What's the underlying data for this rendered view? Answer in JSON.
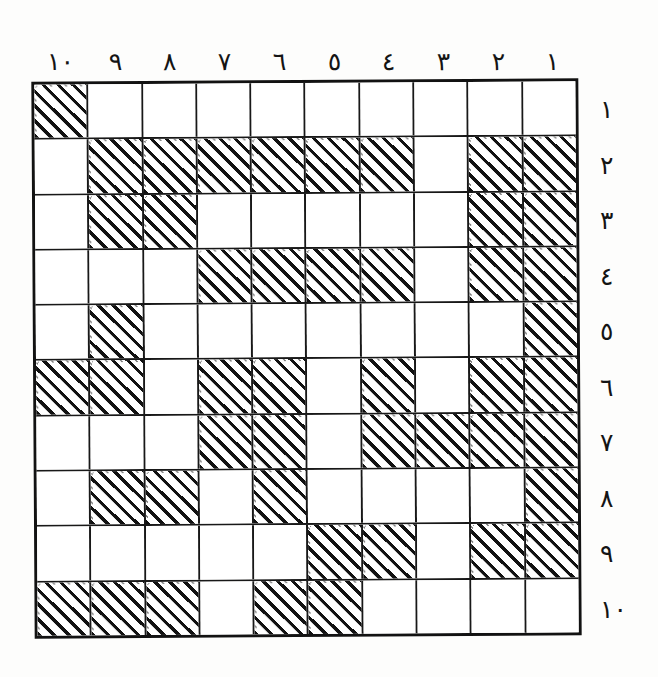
{
  "figure": {
    "type": "hand-drawn-grid",
    "rows": 10,
    "columns": 10,
    "numeral_system": "arabic-indic",
    "column_order": "right-to-left",
    "ink_color": "#141414",
    "paper_color": "#fdfdfc"
  },
  "column_labels": [
    "١٠",
    "٩",
    "٨",
    "٧",
    "٦",
    "٥",
    "٤",
    "٣",
    "٢",
    "١"
  ],
  "row_labels": [
    "١",
    "٢",
    "٣",
    "٤",
    "٥",
    "٦",
    "٧",
    "٨",
    "٩",
    "١٠"
  ],
  "column_labels_latin": [
    10,
    9,
    8,
    7,
    6,
    5,
    4,
    3,
    2,
    1
  ],
  "row_labels_latin": [
    1,
    2,
    3,
    4,
    5,
    6,
    7,
    8,
    9,
    10
  ],
  "grid": {
    "legend": {
      "1": "shaded-hatched",
      "0": "empty"
    },
    "cells": [
      [
        1,
        0,
        0,
        0,
        0,
        0,
        0,
        0,
        0,
        0
      ],
      [
        0,
        1,
        1,
        1,
        1,
        1,
        1,
        0,
        1,
        1
      ],
      [
        0,
        1,
        1,
        0,
        0,
        0,
        0,
        0,
        1,
        1
      ],
      [
        0,
        0,
        0,
        1,
        1,
        1,
        1,
        0,
        1,
        1
      ],
      [
        0,
        1,
        0,
        0,
        0,
        0,
        0,
        0,
        0,
        1
      ],
      [
        1,
        1,
        0,
        1,
        1,
        0,
        1,
        0,
        1,
        1
      ],
      [
        0,
        0,
        0,
        1,
        1,
        0,
        1,
        1,
        1,
        1
      ],
      [
        0,
        1,
        1,
        0,
        1,
        0,
        0,
        0,
        0,
        1
      ],
      [
        0,
        0,
        0,
        0,
        0,
        1,
        1,
        0,
        1,
        1
      ],
      [
        1,
        1,
        1,
        0,
        1,
        1,
        0,
        0,
        0,
        0
      ]
    ],
    "shaded_count": 47
  }
}
